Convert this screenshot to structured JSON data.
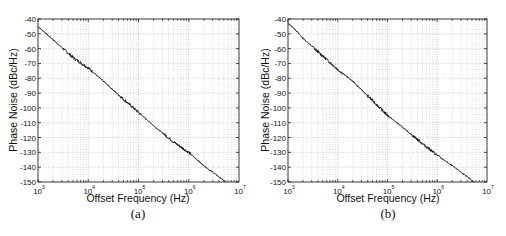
{
  "panels": [
    {
      "caption": "(a)",
      "xlabel": "Offset Frequency (Hz)",
      "ylabel": "Phase Noise (dBc/Hz)"
    },
    {
      "caption": "(b)",
      "xlabel": "Offset Frequency (Hz)",
      "ylabel": "Phase Noise (dBc/Hz)"
    }
  ],
  "chart_data": [
    {
      "type": "line",
      "title": "(a)",
      "xlabel": "Offset Frequency (Hz)",
      "ylabel": "Phase Noise (dBc/Hz)",
      "xscale": "log",
      "xlim": [
        1000,
        10000000
      ],
      "ylim": [
        -150,
        -40
      ],
      "xticks": [
        1000,
        10000,
        100000,
        1000000,
        10000000
      ],
      "xtick_labels": [
        "10^3",
        "10^4",
        "10^5",
        "10^6",
        "10^7"
      ],
      "yticks": [
        -40,
        -50,
        -60,
        -70,
        -80,
        -90,
        -100,
        -110,
        -120,
        -130,
        -140,
        -150
      ],
      "grid": true,
      "legend": null,
      "series": [
        {
          "name": "phase noise",
          "x": [
            1000,
            2000,
            5000,
            10000,
            20000,
            50000,
            100000,
            200000,
            500000,
            1000000,
            2000000,
            5500000
          ],
          "y": [
            -45,
            -54,
            -66,
            -73,
            -82,
            -94,
            -103,
            -112,
            -123,
            -130,
            -139,
            -150
          ]
        }
      ]
    },
    {
      "type": "line",
      "title": "(b)",
      "xlabel": "Offset Frequency (Hz)",
      "ylabel": "Phase Noise (dBc/Hz)",
      "xscale": "log",
      "xlim": [
        1000,
        10000000
      ],
      "ylim": [
        -150,
        -40
      ],
      "xticks": [
        1000,
        10000,
        100000,
        1000000,
        10000000
      ],
      "xtick_labels": [
        "10^3",
        "10^4",
        "10^5",
        "10^6",
        "10^7"
      ],
      "yticks": [
        -40,
        -50,
        -60,
        -70,
        -80,
        -90,
        -100,
        -110,
        -120,
        -130,
        -140,
        -150
      ],
      "grid": true,
      "legend": null,
      "series": [
        {
          "name": "phase noise",
          "x": [
            1000,
            1300,
            2000,
            5000,
            10000,
            20000,
            50000,
            100000,
            200000,
            500000,
            1000000,
            2000000,
            5500000
          ],
          "y": [
            -43,
            -46,
            -53,
            -65,
            -74,
            -82,
            -95,
            -105,
            -113,
            -124,
            -132,
            -139,
            -150
          ]
        }
      ]
    }
  ]
}
